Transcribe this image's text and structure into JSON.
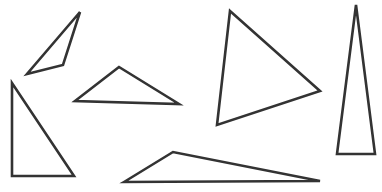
{
  "canvas": {
    "width": 382,
    "height": 192,
    "background": "#ffffff",
    "stroke_color": "#333333",
    "stroke_width": 2.6
  },
  "triangles": [
    {
      "id": "triangle-1",
      "kind": "obtuse-scalene",
      "points": "80,12 27,74 63,65"
    },
    {
      "id": "triangle-2",
      "kind": "right",
      "points": "12,83 12,176 74,176"
    },
    {
      "id": "triangle-3",
      "kind": "obtuse",
      "points": "119,67 75,101 179,104"
    },
    {
      "id": "triangle-4",
      "kind": "obtuse-scalene",
      "points": "124,182 173,152 320,181"
    },
    {
      "id": "triangle-5",
      "kind": "acute",
      "points": "230,11 320,91 217,125"
    },
    {
      "id": "triangle-6",
      "kind": "acute-isosceles",
      "points": "356,5 337,154 375,154"
    }
  ]
}
